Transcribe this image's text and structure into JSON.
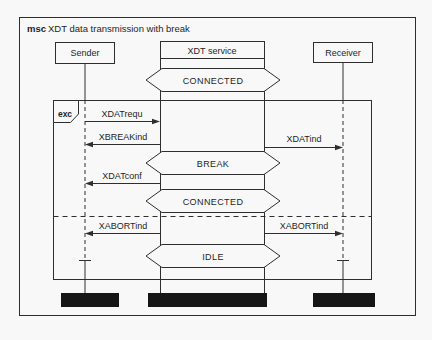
{
  "diagram": {
    "keyword": "msc",
    "title": "XDT data transmission with break"
  },
  "instances": [
    {
      "name": "Sender"
    },
    {
      "name": "XDT service"
    },
    {
      "name": "Receiver"
    }
  ],
  "states": [
    {
      "label": "CONNECTED"
    },
    {
      "label": "BREAK"
    },
    {
      "label": "CONNECTED"
    },
    {
      "label": "IDLE"
    }
  ],
  "messages": [
    {
      "label": "XDATrequ",
      "from": "Sender",
      "to": "XDT service"
    },
    {
      "label": "XBREAKind",
      "from": "XDT service",
      "to": "Sender"
    },
    {
      "label": "XDATind",
      "from": "XDT service",
      "to": "Receiver"
    },
    {
      "label": "XDATconf",
      "from": "XDT service",
      "to": "Sender"
    },
    {
      "label": "XABORTind",
      "from": "XDT service",
      "to": "Sender"
    },
    {
      "label": "XABORTind",
      "from": "XDT service",
      "to": "Receiver"
    }
  ],
  "exception": {
    "label": "exc"
  },
  "colors": {
    "line": "#2e2e2e",
    "end_bar": "#161616",
    "background": "#f8f8f8"
  }
}
